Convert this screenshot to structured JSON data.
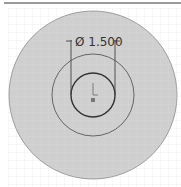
{
  "dimension": {
    "label": "Ø 1.500",
    "symbol": "Ø",
    "value": "1.500"
  },
  "circles": [
    {
      "name": "outer",
      "r": 84,
      "fill": "#cfcfcf"
    },
    {
      "name": "middle",
      "r": 41
    },
    {
      "name": "inner",
      "r": 22
    }
  ],
  "colors": {
    "grid": "#e3e3e3",
    "face": "#cfcfcf",
    "line": "#555555"
  }
}
